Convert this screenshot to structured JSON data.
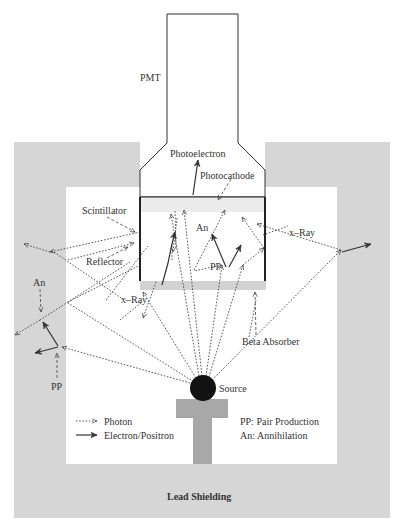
{
  "labels": {
    "pmt": "PMT",
    "photoelectron": "Photoelectron",
    "photocathode": "Photocathode",
    "scintillator": "Scintillator",
    "reflector": "Reflector",
    "an_inside": "An",
    "pp_inside": "PP",
    "xray_right": "x–Ray",
    "xray_left": "x–Ray",
    "an_left": "An",
    "pp_left": "PP",
    "beta_absorber": "Beta Absorber",
    "source": "Source",
    "lead_shielding": "Lead Shielding"
  },
  "legend": {
    "photon": "Photon",
    "electron_positron": "Electron/Positron",
    "pp_def": "PP: Pair Production",
    "an_def": "An: Annihilation"
  },
  "colors": {
    "shielding": "#d6d6d6",
    "absorber": "#d2d2d2",
    "stand": "#a8a8a8",
    "source": "#111111",
    "outline": "#333333"
  }
}
